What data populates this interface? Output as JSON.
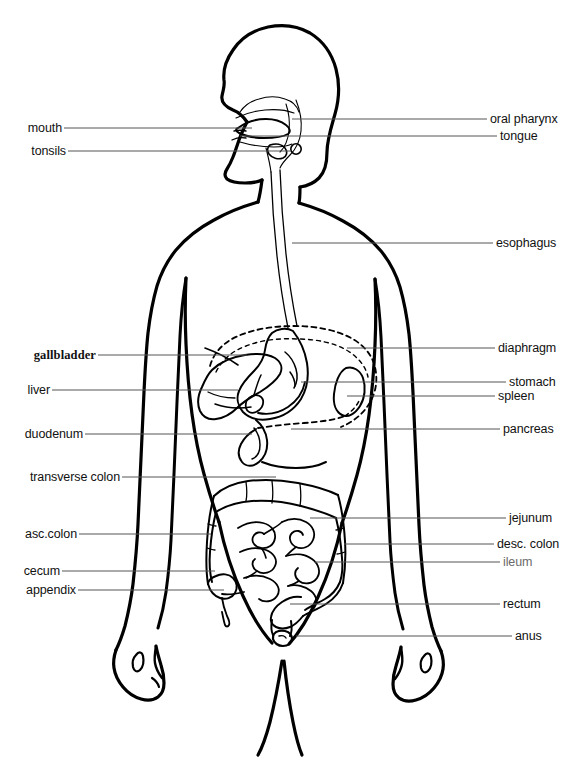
{
  "diagram": {
    "view": "anterior body outline with sagittal head profile",
    "style": {
      "background": "#ffffff",
      "outline_color": "#000000",
      "leader_line_color": "#555555",
      "label_color": "#111111",
      "faint_label_color": "#6a6a6a"
    },
    "labels_left": [
      {
        "id": "mouth",
        "text": "mouth"
      },
      {
        "id": "tonsils",
        "text": "tonsils"
      },
      {
        "id": "gallbladder",
        "text": "gallbladder"
      },
      {
        "id": "liver",
        "text": "liver"
      },
      {
        "id": "duodenum",
        "text": "duodenum"
      },
      {
        "id": "transverse-colon",
        "text": "transverse colon"
      },
      {
        "id": "asc-colon",
        "text": "asc.colon"
      },
      {
        "id": "cecum",
        "text": "cecum"
      },
      {
        "id": "appendix",
        "text": "appendix"
      }
    ],
    "labels_right": [
      {
        "id": "oral-pharynx",
        "text": "oral pharynx"
      },
      {
        "id": "tongue",
        "text": "tongue"
      },
      {
        "id": "esophagus",
        "text": "esophagus"
      },
      {
        "id": "diaphragm",
        "text": "diaphragm"
      },
      {
        "id": "stomach",
        "text": "stomach"
      },
      {
        "id": "spleen",
        "text": "spleen"
      },
      {
        "id": "pancreas",
        "text": "pancreas"
      },
      {
        "id": "jejunum",
        "text": "jejunum"
      },
      {
        "id": "desc-colon",
        "text": "desc. colon"
      },
      {
        "id": "ileum",
        "text": "ileum"
      },
      {
        "id": "rectum",
        "text": "rectum"
      },
      {
        "id": "anus",
        "text": "anus"
      }
    ]
  }
}
